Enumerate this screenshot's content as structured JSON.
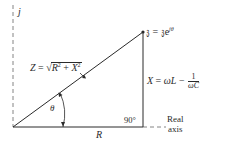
{
  "diagram": {
    "axes": {
      "imaginary_label": "j",
      "real_label_line1": "Real",
      "real_label_line2": "axis"
    },
    "labels": {
      "impedance_name": "Z",
      "impedance_equals": " = ",
      "impedance_sqrt_symbol": "√",
      "impedance_R": "R",
      "impedance_R_exp": "2",
      "impedance_plus": " + ",
      "impedance_X": "X",
      "impedance_X_exp": "2",
      "phasor_symbol": "𝔷",
      "phasor_equals": " = ",
      "phasor_base": "𝔷e",
      "phasor_exp": "jθ",
      "angle": "θ",
      "right_angle": "90°",
      "resistance": "R",
      "reactance_name": "X",
      "reactance_equals": " = ",
      "reactance_term1": "ωL",
      "reactance_minus": " − ",
      "reactance_frac_num": "1",
      "reactance_frac_den": "ωC"
    },
    "geometry": {
      "origin": [
        13,
        127
      ],
      "tip": [
        143,
        32
      ],
      "base_end": [
        143,
        127
      ],
      "real_axis_dashed_end": [
        165,
        127
      ],
      "imag_axis_top": [
        13,
        5
      ]
    },
    "colors": {
      "stroke": "#2a2a2a",
      "dashed": "#777777",
      "background": "#ffffff"
    }
  }
}
